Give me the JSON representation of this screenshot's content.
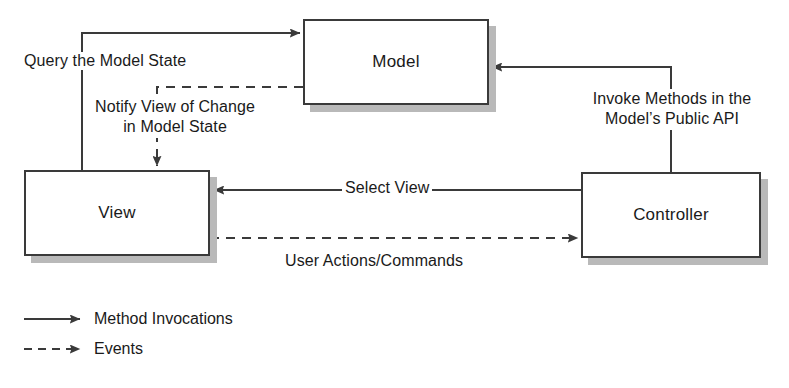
{
  "diagram": {
    "nodes": [
      {
        "id": "model",
        "label": "Model"
      },
      {
        "id": "view",
        "label": "View"
      },
      {
        "id": "controller",
        "label": "Controller"
      }
    ],
    "edges": [
      {
        "id": "query-model-state",
        "label": "Query the Model State",
        "from": "view",
        "to": "model",
        "style": "solid",
        "arrow": "Method Invocations"
      },
      {
        "id": "notify-view-of-change",
        "label_line1": "Notify View of Change",
        "label_line2": "in  Model State",
        "from": "model",
        "to": "view",
        "style": "dashed",
        "arrow": "Events"
      },
      {
        "id": "invoke-methods",
        "label_line1": "Invoke Methods in the",
        "label_line2": "Model’s Public API",
        "from": "controller",
        "to": "model",
        "style": "solid",
        "arrow": "Method Invocations"
      },
      {
        "id": "select-view",
        "label": "Select View",
        "from": "controller",
        "to": "view",
        "style": "solid",
        "arrow": "Method Invocations"
      },
      {
        "id": "user-actions-commands",
        "label": "User Actions/Commands",
        "from": "view",
        "to": "controller",
        "style": "dashed",
        "arrow": "Events"
      }
    ],
    "legend": [
      {
        "id": "method-invocations",
        "label": "Method Invocations",
        "style": "solid"
      },
      {
        "id": "events",
        "label": "Events",
        "style": "dashed"
      }
    ],
    "colors": {
      "line": "#3a3a3a",
      "box_border": "#3a3a3a",
      "box_fill": "#ffffff",
      "shadow": "#b9b9b9",
      "text": "#1a1a1a",
      "background": "#ffffff"
    }
  }
}
